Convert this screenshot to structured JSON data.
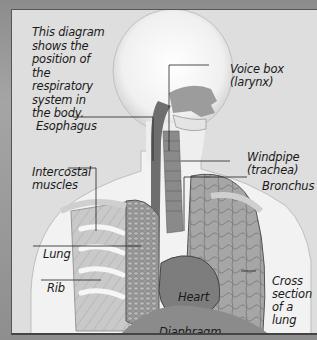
{
  "diagram": {
    "title": "Respiratory system",
    "intro_text": "This diagram\nshows the\nposition of\nthe respiratory\nsystem in\nthe body.",
    "colors": {
      "frame": "#9a9a9a",
      "background": "#dedede",
      "body": "#f4f4f4",
      "lung": "#8f8f8f",
      "heart": "#7d7d7d",
      "leader_line": "#222222"
    },
    "labels": [
      {
        "id": "voice-box",
        "text": "Voice box\n(larynx)"
      },
      {
        "id": "esophagus",
        "text": "Esophagus"
      },
      {
        "id": "windpipe",
        "text": "Windpipe\n(trachea)"
      },
      {
        "id": "intercostal-muscles",
        "text": "Intercostal\nmuscles"
      },
      {
        "id": "bronchus",
        "text": "Bronchus"
      },
      {
        "id": "lung",
        "text": "Lung"
      },
      {
        "id": "rib",
        "text": "Rib"
      },
      {
        "id": "heart",
        "text": "Heart"
      },
      {
        "id": "cross-section",
        "text": "Cross\nsection\nof a lung"
      },
      {
        "id": "diaphragm",
        "text": "Diaphragm"
      }
    ]
  }
}
